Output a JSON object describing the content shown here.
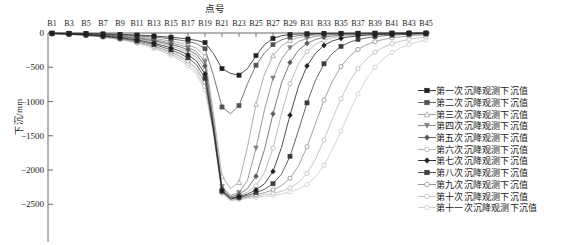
{
  "chart_data": {
    "type": "line",
    "title": "点号",
    "xlabel": "",
    "ylabel": "下沉/mm",
    "ylim": [
      -2700,
      0
    ],
    "yticks": [
      0,
      -500,
      -1000,
      -1500,
      -2000,
      -2500
    ],
    "ytick_labels": [
      "0",
      "−500",
      "−1000",
      "−1500",
      "−2000",
      "−2500"
    ],
    "grid": false,
    "legend_position": "right",
    "categories": [
      "B1",
      "B2",
      "B3",
      "B4",
      "B5",
      "B6",
      "B7",
      "B8",
      "B9",
      "B10",
      "B11",
      "B12",
      "B13",
      "B14",
      "B15",
      "B16",
      "B17",
      "B18",
      "B19",
      "B20",
      "B21",
      "B22",
      "B23",
      "B24",
      "B25",
      "B26",
      "B27",
      "B28",
      "B29",
      "B30",
      "B31",
      "B32",
      "B33",
      "B34",
      "B35",
      "B36",
      "B37",
      "B38",
      "B39",
      "B40",
      "B41",
      "B42",
      "B43",
      "B44",
      "B45"
    ],
    "xtick_labels": [
      "B1",
      "B3",
      "B5",
      "B7",
      "B9",
      "B11",
      "B13",
      "B15",
      "B17",
      "B19",
      "B21",
      "B23",
      "B25",
      "B27",
      "B29",
      "B31",
      "B33",
      "B35",
      "B37",
      "B39",
      "B41",
      "B43",
      "B45"
    ],
    "series": [
      {
        "name": "第一次沉降观测下沉值",
        "color": "#222222",
        "marker": "square-filled",
        "values": [
          -2,
          -3,
          -4,
          -5,
          -8,
          -10,
          -13,
          -16,
          -20,
          -24,
          -30,
          -36,
          -44,
          -52,
          -62,
          -74,
          -88,
          -108,
          -140,
          -300,
          -520,
          -590,
          -615,
          -520,
          -330,
          -170,
          -80,
          -40,
          -22,
          -14,
          -10,
          -8,
          -6,
          -5,
          -4,
          -4,
          -3,
          -3,
          -2,
          -2,
          -2,
          -2,
          -1,
          -1,
          -1
        ]
      },
      {
        "name": "第二次沉降观测下沉值",
        "color": "#555555",
        "marker": "square-filled",
        "values": [
          -3,
          -4,
          -6,
          -8,
          -11,
          -14,
          -18,
          -22,
          -27,
          -33,
          -41,
          -50,
          -60,
          -72,
          -86,
          -103,
          -124,
          -155,
          -230,
          -620,
          -1080,
          -1180,
          -1060,
          -740,
          -470,
          -290,
          -170,
          -100,
          -60,
          -38,
          -26,
          -18,
          -14,
          -11,
          -9,
          -7,
          -6,
          -5,
          -4,
          -4,
          -3,
          -3,
          -2,
          -2,
          -2
        ]
      },
      {
        "name": "第三次沉降观测下沉值",
        "color": "#9a9a9a",
        "marker": "triangle-open",
        "values": [
          -4,
          -6,
          -8,
          -11,
          -15,
          -19,
          -24,
          -30,
          -37,
          -45,
          -56,
          -68,
          -82,
          -99,
          -118,
          -142,
          -172,
          -220,
          -340,
          -1180,
          -2090,
          -2270,
          -2180,
          -1660,
          -1040,
          -600,
          -330,
          -190,
          -110,
          -66,
          -44,
          -30,
          -22,
          -17,
          -13,
          -11,
          -9,
          -7,
          -6,
          -5,
          -4,
          -4,
          -3,
          -3,
          -2
        ]
      },
      {
        "name": "第四次沉降观测下沉值",
        "color": "#7f7f7f",
        "marker": "triangle-down",
        "values": [
          -5,
          -7,
          -10,
          -13,
          -18,
          -23,
          -29,
          -36,
          -45,
          -55,
          -68,
          -83,
          -100,
          -121,
          -145,
          -174,
          -211,
          -270,
          -420,
          -1280,
          -2240,
          -2370,
          -2330,
          -2150,
          -1680,
          -1120,
          -660,
          -380,
          -215,
          -125,
          -78,
          -50,
          -34,
          -25,
          -19,
          -15,
          -12,
          -10,
          -8,
          -7,
          -6,
          -5,
          -4,
          -3,
          -3
        ]
      },
      {
        "name": "第五次沉降观测下沉值",
        "color": "#5a5a5a",
        "marker": "diamond-filled",
        "values": [
          -6,
          -8,
          -11,
          -15,
          -20,
          -26,
          -33,
          -41,
          -51,
          -63,
          -78,
          -95,
          -115,
          -139,
          -167,
          -200,
          -243,
          -312,
          -480,
          -1330,
          -2270,
          -2390,
          -2360,
          -2270,
          -2090,
          -1700,
          -1180,
          -730,
          -430,
          -250,
          -150,
          -94,
          -62,
          -43,
          -31,
          -24,
          -19,
          -15,
          -12,
          -10,
          -8,
          -7,
          -6,
          -5,
          -4
        ]
      },
      {
        "name": "第六次沉降观测下沉值",
        "color": "#adadad",
        "marker": "circle-open",
        "values": [
          -7,
          -9,
          -13,
          -17,
          -23,
          -29,
          -37,
          -47,
          -58,
          -72,
          -89,
          -108,
          -131,
          -158,
          -190,
          -228,
          -277,
          -355,
          -540,
          -1370,
          -2290,
          -2400,
          -2380,
          -2320,
          -2230,
          -2040,
          -1680,
          -1180,
          -740,
          -450,
          -270,
          -165,
          -105,
          -70,
          -50,
          -37,
          -28,
          -22,
          -17,
          -14,
          -11,
          -9,
          -8,
          -6,
          -5
        ]
      },
      {
        "name": "第七次沉降观测下沉值",
        "color": "#1f1f1f",
        "marker": "diamond-filled",
        "values": [
          -8,
          -11,
          -15,
          -20,
          -26,
          -34,
          -43,
          -54,
          -67,
          -83,
          -102,
          -124,
          -150,
          -182,
          -218,
          -262,
          -318,
          -408,
          -600,
          -1400,
          -2300,
          -2410,
          -2390,
          -2350,
          -2290,
          -2200,
          -2020,
          -1670,
          -1200,
          -780,
          -480,
          -295,
          -180,
          -115,
          -78,
          -56,
          -42,
          -32,
          -25,
          -20,
          -16,
          -13,
          -10,
          -8,
          -7
        ]
      },
      {
        "name": "第八次沉降观测下沉值",
        "color": "#3d3d3d",
        "marker": "square-filled",
        "values": [
          -9,
          -12,
          -17,
          -22,
          -30,
          -38,
          -49,
          -61,
          -76,
          -94,
          -116,
          -141,
          -170,
          -206,
          -248,
          -298,
          -362,
          -464,
          -660,
          -1420,
          -2310,
          -2420,
          -2400,
          -2370,
          -2330,
          -2280,
          -2200,
          -2060,
          -1800,
          -1420,
          -1020,
          -690,
          -450,
          -295,
          -195,
          -135,
          -96,
          -70,
          -52,
          -40,
          -31,
          -24,
          -19,
          -15,
          -12
        ]
      },
      {
        "name": "第九次沉降观测下沉值",
        "color": "#8a8a8a",
        "marker": "circle-open",
        "values": [
          -10,
          -14,
          -19,
          -25,
          -33,
          -43,
          -55,
          -69,
          -86,
          -106,
          -131,
          -159,
          -192,
          -233,
          -280,
          -336,
          -409,
          -524,
          -720,
          -1440,
          -2320,
          -2430,
          -2410,
          -2390,
          -2360,
          -2330,
          -2290,
          -2230,
          -2120,
          -1940,
          -1660,
          -1320,
          -980,
          -700,
          -490,
          -340,
          -240,
          -172,
          -126,
          -94,
          -71,
          -55,
          -43,
          -34,
          -27
        ]
      },
      {
        "name": "第十次沉降观测下沉值",
        "color": "#b8b8b8",
        "marker": "circle-open",
        "values": [
          -11,
          -15,
          -21,
          -27,
          -36,
          -47,
          -60,
          -75,
          -94,
          -116,
          -143,
          -174,
          -210,
          -254,
          -306,
          -367,
          -447,
          -572,
          -780,
          -1460,
          -2330,
          -2440,
          -2420,
          -2400,
          -2380,
          -2360,
          -2340,
          -2310,
          -2260,
          -2180,
          -2050,
          -1840,
          -1560,
          -1250,
          -960,
          -710,
          -520,
          -380,
          -280,
          -208,
          -157,
          -120,
          -93,
          -73,
          -58
        ]
      },
      {
        "name": "第十一次沉降观测下沉值",
        "color": "#c9c9c9",
        "marker": "circle-open",
        "values": [
          -12,
          -16,
          -22,
          -29,
          -39,
          -50,
          -64,
          -80,
          -100,
          -124,
          -153,
          -186,
          -225,
          -272,
          -327,
          -393,
          -478,
          -612,
          -830,
          -1480,
          -2340,
          -2450,
          -2430,
          -2415,
          -2400,
          -2385,
          -2370,
          -2350,
          -2320,
          -2280,
          -2210,
          -2100,
          -1930,
          -1700,
          -1430,
          -1150,
          -890,
          -670,
          -500,
          -375,
          -283,
          -217,
          -168,
          -132,
          -104
        ]
      }
    ]
  }
}
